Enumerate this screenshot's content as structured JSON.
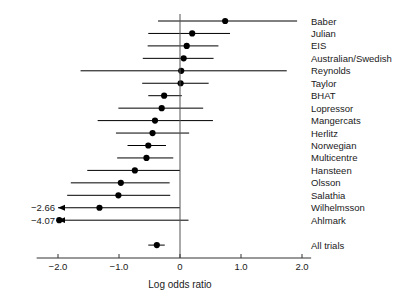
{
  "chart_data": {
    "type": "scatter",
    "title": "",
    "subtitle": "",
    "xlabel": "Log odds ratio",
    "ylabel": "",
    "xlim": [
      -2.35,
      2.15
    ],
    "xticks": [
      -2.0,
      -1.0,
      0,
      1.0,
      2.0
    ],
    "xticklabels": [
      "−2.0",
      "−1.0",
      "0",
      "1.0",
      "2.0"
    ],
    "grid": false,
    "legend": false,
    "reference_line": 0,
    "categories": [
      "Baber",
      "Julian",
      "EIS",
      "Australian/Swedish",
      "Reynolds",
      "Taylor",
      "BHAT",
      "Lopressor",
      "Mangercats",
      "Herlitz",
      "Norwegian",
      "Multicentre",
      "Hansteen",
      "Olsson",
      "Salathia",
      "Wilhelmsson",
      "Ahlmark",
      "All trials"
    ],
    "series": [
      {
        "name": "Log odds ratio with 95% CI",
        "points": [
          {
            "label": "Baber",
            "estimate": 0.74,
            "ci_low": -0.36,
            "ci_high": 1.92,
            "low_clipped": false,
            "high_clipped": false,
            "clip_label": ""
          },
          {
            "label": "Julian",
            "estimate": 0.2,
            "ci_low": -0.52,
            "ci_high": 0.82,
            "low_clipped": false,
            "high_clipped": false,
            "clip_label": ""
          },
          {
            "label": "EIS",
            "estimate": 0.11,
            "ci_low": -0.53,
            "ci_high": 0.63,
            "low_clipped": false,
            "high_clipped": false,
            "clip_label": ""
          },
          {
            "label": "Australian/Swedish",
            "estimate": 0.06,
            "ci_low": -0.61,
            "ci_high": 0.55,
            "low_clipped": false,
            "high_clipped": false,
            "clip_label": ""
          },
          {
            "label": "Reynolds",
            "estimate": 0.02,
            "ci_low": -1.63,
            "ci_high": 1.75,
            "low_clipped": false,
            "high_clipped": false,
            "clip_label": ""
          },
          {
            "label": "Taylor",
            "estimate": 0.01,
            "ci_low": -0.62,
            "ci_high": 0.47,
            "low_clipped": false,
            "high_clipped": false,
            "clip_label": ""
          },
          {
            "label": "BHAT",
            "estimate": -0.26,
            "ci_low": -0.52,
            "ci_high": 0.03,
            "low_clipped": false,
            "high_clipped": false,
            "clip_label": ""
          },
          {
            "label": "Lopressor",
            "estimate": -0.3,
            "ci_low": -1.01,
            "ci_high": 0.38,
            "low_clipped": false,
            "high_clipped": false,
            "clip_label": ""
          },
          {
            "label": "Mangercats",
            "estimate": -0.41,
            "ci_low": -1.35,
            "ci_high": 0.54,
            "low_clipped": false,
            "high_clipped": false,
            "clip_label": ""
          },
          {
            "label": "Herlitz",
            "estimate": -0.45,
            "ci_low": -1.05,
            "ci_high": 0.15,
            "low_clipped": false,
            "high_clipped": false,
            "clip_label": ""
          },
          {
            "label": "Norwegian",
            "estimate": -0.52,
            "ci_low": -0.86,
            "ci_high": -0.23,
            "low_clipped": false,
            "high_clipped": false,
            "clip_label": ""
          },
          {
            "label": "Multicentre",
            "estimate": -0.55,
            "ci_low": -1.03,
            "ci_high": -0.11,
            "low_clipped": false,
            "high_clipped": false,
            "clip_label": ""
          },
          {
            "label": "Hansteen",
            "estimate": -0.74,
            "ci_low": -1.52,
            "ci_high": 0.0,
            "low_clipped": false,
            "high_clipped": false,
            "clip_label": ""
          },
          {
            "label": "Olsson",
            "estimate": -0.97,
            "ci_low": -1.79,
            "ci_high": -0.17,
            "low_clipped": false,
            "high_clipped": false,
            "clip_label": ""
          },
          {
            "label": "Salathia",
            "estimate": -1.01,
            "ci_low": -1.85,
            "ci_high": -0.16,
            "low_clipped": false,
            "high_clipped": false,
            "clip_label": ""
          },
          {
            "label": "Wilhelmsson",
            "estimate": -1.32,
            "ci_low": -2.66,
            "ci_high": 0.0,
            "low_clipped": true,
            "high_clipped": false,
            "clip_label": "−2.66"
          },
          {
            "label": "Ahlmark",
            "estimate": -1.98,
            "ci_low": -4.07,
            "ci_high": 0.14,
            "low_clipped": true,
            "high_clipped": false,
            "clip_label": "−4.07"
          },
          {
            "label": "All trials",
            "estimate": -0.38,
            "ci_low": -0.52,
            "ci_high": -0.25,
            "low_clipped": false,
            "high_clipped": false,
            "clip_label": ""
          }
        ]
      }
    ]
  },
  "colors": {
    "marker": "#000000",
    "ci_line": "#000000",
    "zero_line": "#555555",
    "axis": "#333333",
    "text": "#1a1a1a",
    "background": "#ffffff"
  }
}
